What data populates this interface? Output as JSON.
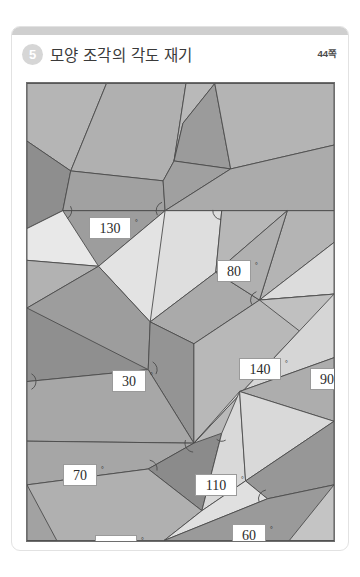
{
  "card": {
    "number_badge": "5",
    "title": "모양 조각의 각도 재기",
    "page_ref": "44쪽"
  },
  "figure": {
    "name": "angle-measurement-tessellation",
    "frame": {
      "x": 14,
      "y": 55,
      "width": 309,
      "height": 460
    },
    "colors": {
      "background": "#b9b9b9",
      "stroke": "#4b4b4b",
      "label_fill": "#ffffff",
      "label_border": "#9a9a9a",
      "tone_lightest": "#e7e7e7",
      "tone_light": "#d4d4d4",
      "tone_mid": "#bdbdbd",
      "tone_medium": "#ababab",
      "tone_dark": "#9a9a9a",
      "tone_darkest": "#8a8a8a"
    },
    "angle_labels": [
      {
        "id": "a130",
        "value": "130",
        "unit": "°",
        "x": 62,
        "y": 134,
        "width": 3
      },
      {
        "id": "a80",
        "value": "80",
        "unit": "°",
        "x": 190,
        "y": 177,
        "width": 2
      },
      {
        "id": "a30",
        "value": "30",
        "unit": "°",
        "x": 85,
        "y": 287,
        "width": 2
      },
      {
        "id": "a140",
        "value": "140",
        "unit": "°",
        "x": 212,
        "y": 275,
        "width": 3
      },
      {
        "id": "a90",
        "value": "90",
        "unit": "°",
        "x": 283,
        "y": 285,
        "width": 2
      },
      {
        "id": "a70",
        "value": "70",
        "unit": "°",
        "x": 36,
        "y": 381,
        "width": 2
      },
      {
        "id": "a110",
        "value": "110",
        "unit": "°",
        "x": 168,
        "y": 391,
        "width": 3
      },
      {
        "id": "a100",
        "value": "100",
        "unit": "°",
        "x": 68,
        "y": 452,
        "width": 3
      },
      {
        "id": "a60",
        "value": "60",
        "unit": "°",
        "x": 205,
        "y": 441,
        "width": 2
      },
      {
        "id": "a105",
        "value": "105",
        "unit": "°",
        "x": 255,
        "y": 494,
        "width": 3
      }
    ],
    "polygons": [
      {
        "id": "p01",
        "tone": "#b5b5b5",
        "points": "0,0 80,0 44,88 0,58"
      },
      {
        "id": "p02",
        "tone": "#b0b0b0",
        "points": "80,0 160,0 148,78 137,98 44,88"
      },
      {
        "id": "p03",
        "tone": "#b9b9b9",
        "points": "160,0 189,0 157,40 148,78"
      },
      {
        "id": "p04",
        "tone": "#9b9b9b",
        "points": "189,0 157,40 148,78 205,86"
      },
      {
        "id": "p05",
        "tone": "#b4b4b4",
        "points": "189,0 309,0 309,62 205,86"
      },
      {
        "id": "p06",
        "tone": "#8e8e8e",
        "points": "0,58 44,88 36,128 0,146"
      },
      {
        "id": "p07",
        "tone": "#a1a1a1",
        "points": "44,88 137,98 139,128 36,128"
      },
      {
        "id": "p08",
        "tone": "#a0a0a0",
        "points": "137,98 148,78 205,86 139,128"
      },
      {
        "id": "p09",
        "tone": "#ababab",
        "points": "205,86 309,62 309,128 139,128"
      },
      {
        "id": "p10",
        "tone": "#9d9d9d",
        "points": "36,128 139,128 72,184 0,178"
      },
      {
        "id": "p11",
        "tone": "#e8e8e8",
        "points": "36,128 72,184 0,178 0,146"
      },
      {
        "id": "p12",
        "tone": "#b2b2b2",
        "points": "0,178 72,184 0,226"
      },
      {
        "id": "p13",
        "tone": "#e3e3e3",
        "points": "72,184 139,128 196,128 124,240"
      },
      {
        "id": "p14",
        "tone": "#dedede",
        "points": "139,128 196,128 190,190 124,240"
      },
      {
        "id": "p15",
        "tone": "#b7b7b7",
        "points": "196,128 262,128 190,190"
      },
      {
        "id": "p16",
        "tone": "#b4b4b4",
        "points": "262,128 309,128 309,160 234,218"
      },
      {
        "id": "p17",
        "tone": "#aaaaaa",
        "points": "190,190 234,218 168,262 124,240"
      },
      {
        "id": "p18",
        "tone": "#b0b0b0",
        "points": "262,128 234,218 190,190"
      },
      {
        "id": "p19",
        "tone": "#dcdcdc",
        "points": "234,218 309,160 309,212"
      },
      {
        "id": "p20",
        "tone": "#9d9d9d",
        "points": "0,226 72,184 124,240 122,288 0,300"
      },
      {
        "id": "p21",
        "tone": "#8f8f8f",
        "points": "0,226 122,288 0,300"
      },
      {
        "id": "p22",
        "tone": "#949494",
        "points": "124,240 168,262 168,362 122,288"
      },
      {
        "id": "p23",
        "tone": "#a7a7a7",
        "points": "0,300 122,288 168,362 0,360"
      },
      {
        "id": "p24",
        "tone": "#b8b8b8",
        "points": "168,262 234,218 309,212 168,362"
      },
      {
        "id": "p25",
        "tone": "#c0c0c0",
        "points": "234,218 309,212 309,276"
      },
      {
        "id": "p26",
        "tone": "#d6d6d6",
        "points": "168,362 309,212 309,276 214,310"
      },
      {
        "id": "p27",
        "tone": "#adadad",
        "points": "214,310 309,276 309,340"
      },
      {
        "id": "p28",
        "tone": "#a6a6a6",
        "points": "0,360 168,362 122,388 0,404"
      },
      {
        "id": "p29",
        "tone": "#8b8b8b",
        "points": "168,362 196,352 176,430 122,388"
      },
      {
        "id": "p30",
        "tone": "#dededede",
        "points": "196,352 214,310 220,400 176,430"
      },
      {
        "id": "p31",
        "tone": "#d9d9d9",
        "points": "214,310 309,340 220,400"
      },
      {
        "id": "p32",
        "tone": "#979797",
        "points": "309,340 309,404 242,418 220,400"
      },
      {
        "id": "p33",
        "tone": "#b0b0b0",
        "points": "0,404 122,388 176,430 138,460 0,460"
      },
      {
        "id": "p34",
        "tone": "#a2a2a2",
        "points": "0,404 0,460 30,460"
      },
      {
        "id": "p35",
        "tone": "#e0e0e0",
        "points": "176,430 220,400 242,418 138,460"
      },
      {
        "id": "p36",
        "tone": "#9a9a9a",
        "points": "242,418 309,404 309,460 138,460"
      },
      {
        "id": "p37",
        "tone": "#c4c4c4",
        "points": "309,404 309,460 264,460"
      }
    ]
  }
}
